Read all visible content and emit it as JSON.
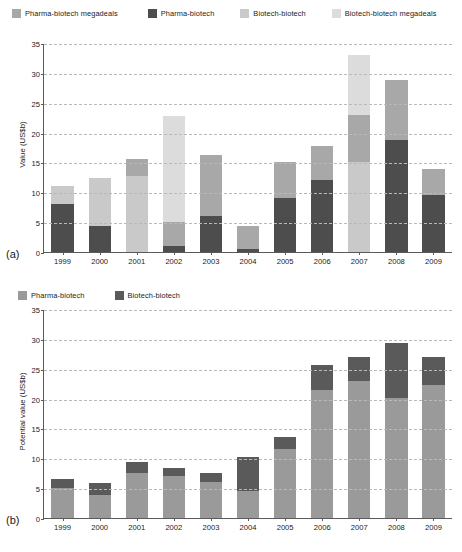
{
  "figure": {
    "panel_a_label": "(a)",
    "panel_b_label": "(b)"
  },
  "colors": {
    "pharma_biotech": "#4d4d4d",
    "biotech_biotech": "#c9c9c9",
    "pharma_biotech_megadeals": "#a8a8a8",
    "biotech_biotech_megadeals": "#dcdcdc",
    "b_pharma_biotech": "#9a9a9a",
    "b_biotech_biotech": "#5a5a5a",
    "grid": "#b9b9b9",
    "axis": "#5a5a5a"
  },
  "chart_a": {
    "legend": [
      {
        "label": "Pharma-biotech megadeals",
        "swatch": "pharma_biotech_megadeals"
      },
      {
        "label": "Pharma-biotech",
        "swatch": "pharma_biotech"
      },
      {
        "label": "Biotech-biotech",
        "swatch": "biotech_biotech"
      },
      {
        "label": "Biotech-biotech megadeals",
        "swatch": "biotech_biotech_megadeals"
      }
    ]
  },
  "chart_b": {
    "legend": [
      {
        "label": "Pharma-biotech",
        "swatch": "b_pharma_biotech"
      },
      {
        "label": "Biotech-biotech",
        "swatch": "b_biotech_biotech"
      }
    ]
  },
  "chart_data": [
    {
      "id": "a",
      "type": "bar",
      "subplot_label": "(a)",
      "title": "",
      "xlabel": "",
      "ylabel": "Value (US$b)",
      "ylim": [
        0,
        35
      ],
      "yticks": [
        0,
        5,
        10,
        15,
        20,
        25,
        30,
        35
      ],
      "ytick_labels": [
        "0",
        "5",
        "10",
        "15",
        "20",
        "25",
        "30",
        "35"
      ],
      "grid": true,
      "stacked": true,
      "legend_position": "top",
      "categories": [
        "1999",
        "2000",
        "2001",
        "2002",
        "2003",
        "2004",
        "2005",
        "2006",
        "2007",
        "2008",
        "2009"
      ],
      "series": [
        {
          "name": "Pharma-biotech",
          "color_key": "pharma_biotech",
          "values": [
            8.0,
            4.4,
            0.0,
            1.0,
            6.0,
            0.5,
            9.0,
            12.0,
            0.0,
            18.7,
            9.5
          ]
        },
        {
          "name": "Biotech-biotech",
          "color_key": "biotech_biotech",
          "values": [
            3.1,
            8.0,
            12.8,
            0.0,
            0.0,
            0.0,
            0.0,
            0.0,
            15.0,
            0.0,
            0.0
          ]
        },
        {
          "name": "Pharma-biotech megadeals",
          "color_key": "pharma_biotech_megadeals",
          "values": [
            0.0,
            0.0,
            2.7,
            4.0,
            10.3,
            3.8,
            6.0,
            5.7,
            8.0,
            10.1,
            4.4
          ]
        },
        {
          "name": "Biotech-biotech megadeals",
          "color_key": "biotech_biotech_megadeals",
          "values": [
            0.0,
            0.0,
            0.0,
            17.8,
            0.0,
            0.0,
            0.0,
            0.0,
            10.0,
            0.0,
            0.0
          ]
        }
      ],
      "totals": [
        11.1,
        12.4,
        15.5,
        22.8,
        16.3,
        4.3,
        15.0,
        17.7,
        33.0,
        28.8,
        13.9
      ]
    },
    {
      "id": "b",
      "type": "bar",
      "subplot_label": "(b)",
      "title": "",
      "xlabel": "",
      "ylabel": "Potential value (US$b)",
      "ylim": [
        0,
        35
      ],
      "yticks": [
        0,
        5,
        10,
        15,
        20,
        25,
        30,
        35
      ],
      "ytick_labels": [
        "0",
        "5",
        "10",
        "15",
        "20",
        "25",
        "30",
        "35"
      ],
      "grid": true,
      "stacked": true,
      "legend_position": "top",
      "categories": [
        "1999",
        "2000",
        "2001",
        "2002",
        "2003",
        "2004",
        "2005",
        "2006",
        "2007",
        "2008",
        "2009"
      ],
      "series": [
        {
          "name": "Pharma-biotech",
          "color_key": "b_pharma_biotech",
          "values": [
            5.0,
            3.9,
            7.6,
            7.1,
            6.1,
            4.6,
            11.5,
            21.4,
            23.0,
            20.1,
            22.2
          ]
        },
        {
          "name": "Biotech-biotech",
          "color_key": "b_biotech_biotech",
          "values": [
            1.6,
            2.0,
            1.8,
            1.3,
            1.5,
            5.7,
            2.1,
            4.2,
            4.0,
            9.2,
            4.8
          ]
        }
      ],
      "totals": [
        6.6,
        5.9,
        9.4,
        8.4,
        7.6,
        10.3,
        13.6,
        25.6,
        27.0,
        29.3,
        27.0
      ]
    }
  ]
}
